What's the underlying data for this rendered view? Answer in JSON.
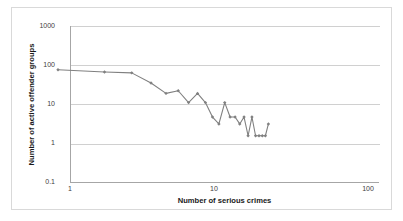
{
  "chart_data": {
    "type": "line",
    "title": "",
    "xlabel": "Number of serious crimes",
    "ylabel": "Number of active offender groups",
    "xscale": "log",
    "yscale": "log",
    "xlim": [
      1,
      100
    ],
    "ylim": [
      0.1,
      1000
    ],
    "grid": true,
    "legend": null,
    "x_ticks": [
      "1",
      "10",
      "100"
    ],
    "x_tick_values": [
      1,
      10,
      100
    ],
    "y_ticks": [
      "1000",
      "100",
      "10",
      "1",
      "0.1"
    ],
    "y_tick_values": [
      1000,
      100,
      10,
      1,
      0.1
    ],
    "marker": "diamond",
    "line_color": "#808080",
    "marker_color": "#808080",
    "series": [
      {
        "name": "active offender groups",
        "x": [
          1,
          2,
          3,
          4,
          5,
          6,
          7,
          8,
          9,
          10,
          11,
          12,
          13,
          14,
          15,
          16,
          17,
          18,
          19,
          20,
          21,
          22,
          23
        ],
        "y": [
          48,
          42,
          40,
          22,
          12,
          14,
          7,
          12,
          7,
          3,
          2,
          7,
          3,
          3,
          2,
          3,
          1,
          3,
          1,
          1,
          1,
          1,
          2
        ]
      }
    ]
  },
  "axis": {
    "y_label_text": "Number of active offender groups",
    "x_label_text": "Number of serious crimes"
  }
}
